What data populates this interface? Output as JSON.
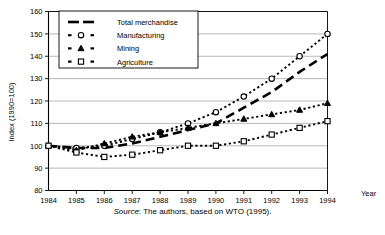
{
  "chart_data": {
    "type": "line",
    "title": "",
    "xlabel": "Year",
    "ylabel": "Index (1990=100)",
    "x": [
      1984,
      1985,
      1986,
      1987,
      1988,
      1989,
      1990,
      1991,
      1992,
      1993,
      1994
    ],
    "xtick_labels": [
      "1984",
      "1985",
      "1986",
      "1987",
      "1988",
      "1989",
      "1990",
      "1991",
      "1992",
      "1993",
      "1994"
    ],
    "ytick_labels": [
      "80",
      "90",
      "100",
      "110",
      "120",
      "130",
      "140",
      "150",
      "160"
    ],
    "ylim": [
      80,
      160
    ],
    "xlim": [
      1984,
      1994
    ],
    "ytick_step": 10,
    "grid": "horizontal",
    "legend_position": "top-left-inside",
    "series": [
      {
        "name": "Total merchandise",
        "marker": "none",
        "linestyle": "long-dash",
        "values": [
          100,
          99,
          99,
          101,
          104,
          107,
          110,
          117,
          124,
          133,
          141
        ]
      },
      {
        "name": "Manufacturing",
        "marker": "circle",
        "linestyle": "dotted-dash",
        "values": [
          100,
          99,
          100,
          103,
          106,
          110,
          115,
          122,
          130,
          140,
          150
        ]
      },
      {
        "name": "Mining",
        "marker": "triangle",
        "linestyle": "dotted-dash",
        "values": [
          100,
          98,
          101,
          104,
          106,
          108,
          110,
          112,
          114,
          116,
          119
        ]
      },
      {
        "name": "Agriculture",
        "marker": "square",
        "linestyle": "dotted-dash",
        "values": [
          100,
          97,
          95,
          96,
          98,
          100,
          100,
          102,
          105,
          108,
          111
        ]
      }
    ]
  },
  "source": {
    "prefix": "Source",
    "text": ": The authors, based on WTO (1995)."
  },
  "colors": {
    "ink": "#000000",
    "grid": "#8a8a8a",
    "background": "#ffffff"
  }
}
